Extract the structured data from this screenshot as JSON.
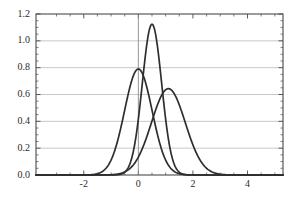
{
  "chart_data": {
    "type": "line",
    "title": "",
    "subtitle": "",
    "xlabel": "",
    "ylabel": "",
    "xlim": [
      -3.75,
      5.3
    ],
    "ylim": [
      0.0,
      1.2
    ],
    "grid": true,
    "grid_color": "#b0b0b0",
    "axis_color": "#4a4a4a",
    "line_color": "#2e2e2e",
    "background": "#ffffff",
    "legend": "none",
    "x_ticks": [
      -2,
      0,
      2,
      4
    ],
    "x_tick_labels": [
      "-2",
      "0",
      "2",
      "4"
    ],
    "x_minor_ticks": [
      -3,
      -2.5,
      -1.5,
      -1,
      -0.5,
      0.5,
      1,
      1.5,
      2.5,
      3,
      3.5,
      4.5,
      5
    ],
    "y_ticks": [
      0.0,
      0.2,
      0.4,
      0.6,
      0.8,
      1.0,
      1.2
    ],
    "y_tick_labels": [
      "0.0",
      "0.2",
      "0.4",
      "0.6",
      "0.8",
      "1.0",
      "1.2"
    ],
    "y_minor_ticks": [
      0.05,
      0.1,
      0.15,
      0.25,
      0.3,
      0.35,
      0.45,
      0.5,
      0.55,
      0.65,
      0.7,
      0.75,
      0.85,
      0.9,
      0.95,
      1.05,
      1.1,
      1.15
    ],
    "vertical_reference_line_x": 0,
    "series": [
      {
        "name": "narrow-peaked-curve",
        "distribution": "normal",
        "mean": 0.5,
        "sigma": 0.355,
        "peak_value": 1.123,
        "peak_x": 0.5
      },
      {
        "name": "medium-curve",
        "distribution": "normal",
        "mean": 0.0,
        "sigma": 0.505,
        "peak_value": 0.79,
        "peak_x": 0.0
      },
      {
        "name": "broad-curve",
        "distribution": "normal",
        "mean": 1.1,
        "sigma": 0.62,
        "peak_value": 0.643,
        "peak_x": 1.1
      }
    ]
  }
}
